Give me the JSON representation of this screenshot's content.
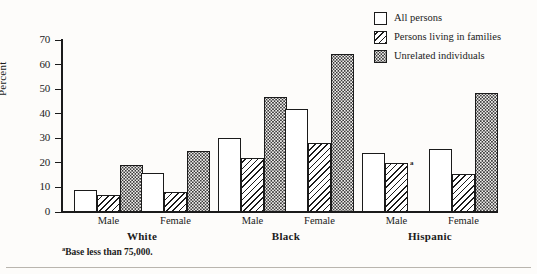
{
  "axis": {
    "ylabel": "Percent",
    "yticks": [
      0,
      10,
      20,
      30,
      40,
      50,
      60,
      70
    ],
    "ymin": 0,
    "ymax": 70
  },
  "legend": {
    "items": [
      {
        "label": "All persons",
        "pattern": "solid"
      },
      {
        "label": "Persons living in families",
        "pattern": "diagonal-hatch"
      },
      {
        "label": "Unrelated individuals",
        "pattern": "stipple-dots"
      }
    ]
  },
  "groups": [
    {
      "name": "White",
      "sub": [
        "Male",
        "Female"
      ]
    },
    {
      "name": "Black",
      "sub": [
        "Male",
        "Female"
      ]
    },
    {
      "name": "Hispanic",
      "sub": [
        "Male",
        "Female"
      ]
    }
  ],
  "footnote": {
    "marker": "a",
    "text": "Base less than 75,000."
  },
  "bar_note_marker": "a",
  "chart_data": {
    "type": "bar",
    "title": "",
    "xlabel": "",
    "ylabel": "Percent",
    "ylim": [
      0,
      70
    ],
    "yticks": [
      0,
      10,
      20,
      30,
      40,
      50,
      60,
      70
    ],
    "grid": false,
    "legend_position": "top-right",
    "categories": [
      "White Male",
      "White Female",
      "Black Male",
      "Black Female",
      "Hispanic Male",
      "Hispanic Female"
    ],
    "group_labels": [
      "White",
      "Black",
      "Hispanic"
    ],
    "subgroup_labels": [
      "Male",
      "Female",
      "Male",
      "Female",
      "Male",
      "Female"
    ],
    "series": [
      {
        "name": "All persons",
        "pattern": "solid",
        "values": [
          9,
          16,
          30,
          42,
          24,
          25.5
        ]
      },
      {
        "name": "Persons living in families",
        "pattern": "diagonal-hatch",
        "values": [
          7,
          8,
          22,
          28,
          20,
          15.5
        ]
      },
      {
        "name": "Unrelated individuals",
        "pattern": "stipple-dots",
        "values": [
          19,
          25,
          47,
          64.5,
          null,
          48.5
        ]
      }
    ],
    "annotations": [
      {
        "target": "Hispanic Male / Persons living in families",
        "marker": "a",
        "note": "Base less than 75,000."
      }
    ]
  }
}
